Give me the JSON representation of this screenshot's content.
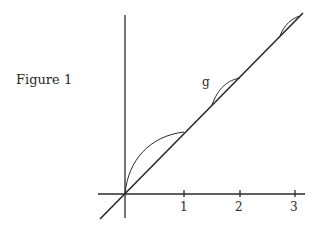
{
  "caption": "Figure 1",
  "curve_label": "g",
  "ticks": [
    {
      "label": "1"
    },
    {
      "label": "2"
    },
    {
      "label": "3"
    }
  ],
  "colors": {
    "ink": "#2a2a2a",
    "background": "#ffffff"
  }
}
